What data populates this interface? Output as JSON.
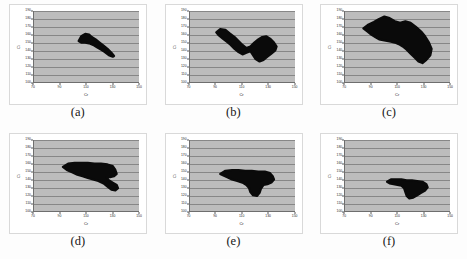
{
  "figure": {
    "title": "",
    "panel_count": 6,
    "background_color": "#ffffff",
    "plot_background_color": "#bcbcbc",
    "blob_color": "#0a0a0a",
    "gridline_color": "#5a5a5a"
  },
  "chart_data": [
    {
      "type": "scatter",
      "title": "",
      "caption": "(a)",
      "xlabel": "Cr",
      "ylabel": "Ci",
      "xlim": [
        70,
        150
      ],
      "ylim": [
        100,
        190
      ],
      "xticks": [
        70,
        90,
        110,
        130,
        150
      ],
      "yticks": [
        100,
        110,
        120,
        130,
        140,
        150,
        160,
        170,
        180,
        190
      ],
      "grid": true,
      "legend": "none",
      "cluster": {
        "x_range": [
          104,
          131
        ],
        "y_range": [
          132,
          161
        ],
        "orientation": "diagonal-descending",
        "area_fraction": 0.09,
        "polygon": [
          [
            104,
            152
          ],
          [
            106,
            158
          ],
          [
            109,
            161
          ],
          [
            112,
            160
          ],
          [
            114,
            157
          ],
          [
            117,
            154
          ],
          [
            120,
            150
          ],
          [
            123,
            146
          ],
          [
            126,
            142
          ],
          [
            129,
            137
          ],
          [
            131,
            133
          ],
          [
            130,
            132
          ],
          [
            127,
            134
          ],
          [
            124,
            138
          ],
          [
            121,
            141
          ],
          [
            118,
            144
          ],
          [
            115,
            147
          ],
          [
            112,
            149
          ],
          [
            109,
            150
          ],
          [
            106,
            150
          ]
        ]
      }
    },
    {
      "type": "scatter",
      "title": "",
      "caption": "(b)",
      "xlabel": "Cr",
      "ylabel": "Ci",
      "xlim": [
        70,
        150
      ],
      "ylim": [
        100,
        190
      ],
      "xticks": [
        70,
        90,
        110,
        130,
        150
      ],
      "yticks": [
        100,
        110,
        120,
        130,
        140,
        150,
        160,
        170,
        180,
        190
      ],
      "grid": true,
      "legend": "none",
      "cluster": {
        "x_range": [
          90,
          136
        ],
        "y_range": [
          126,
          167
        ],
        "orientation": "diagonal-descending-bilobed",
        "area_fraction": 0.2,
        "polygon": [
          [
            90,
            163
          ],
          [
            93,
            167
          ],
          [
            97,
            166
          ],
          [
            100,
            162
          ],
          [
            104,
            157
          ],
          [
            107,
            152
          ],
          [
            110,
            147
          ],
          [
            113,
            143
          ],
          [
            116,
            145
          ],
          [
            119,
            150
          ],
          [
            122,
            154
          ],
          [
            125,
            157
          ],
          [
            128,
            158
          ],
          [
            131,
            155
          ],
          [
            134,
            150
          ],
          [
            136,
            145
          ],
          [
            135,
            140
          ],
          [
            132,
            136
          ],
          [
            129,
            132
          ],
          [
            126,
            128
          ],
          [
            123,
            126
          ],
          [
            120,
            129
          ],
          [
            118,
            134
          ],
          [
            116,
            139
          ],
          [
            113,
            137
          ],
          [
            110,
            135
          ],
          [
            107,
            138
          ],
          [
            104,
            142
          ],
          [
            101,
            147
          ],
          [
            98,
            151
          ],
          [
            95,
            155
          ],
          [
            92,
            159
          ]
        ]
      }
    },
    {
      "type": "scatter",
      "title": "",
      "caption": "(c)",
      "xlabel": "Cr",
      "ylabel": "Ci",
      "xlim": [
        70,
        150
      ],
      "ylim": [
        100,
        190
      ],
      "xticks": [
        70,
        90,
        110,
        130,
        150
      ],
      "yticks": [
        100,
        110,
        120,
        130,
        140,
        150,
        160,
        170,
        180,
        190
      ],
      "grid": true,
      "legend": "none",
      "cluster": {
        "x_range": [
          84,
          136
        ],
        "y_range": [
          124,
          183
        ],
        "orientation": "diagonal-descending-broad",
        "area_fraction": 0.36,
        "polygon": [
          [
            84,
            168
          ],
          [
            88,
            173
          ],
          [
            92,
            176
          ],
          [
            96,
            180
          ],
          [
            100,
            183
          ],
          [
            104,
            181
          ],
          [
            108,
            177
          ],
          [
            112,
            175
          ],
          [
            116,
            177
          ],
          [
            120,
            175
          ],
          [
            124,
            170
          ],
          [
            128,
            164
          ],
          [
            131,
            158
          ],
          [
            134,
            150
          ],
          [
            136,
            142
          ],
          [
            135,
            134
          ],
          [
            132,
            128
          ],
          [
            129,
            124
          ],
          [
            126,
            126
          ],
          [
            123,
            131
          ],
          [
            120,
            136
          ],
          [
            117,
            141
          ],
          [
            114,
            145
          ],
          [
            111,
            148
          ],
          [
            108,
            150
          ],
          [
            105,
            151
          ],
          [
            102,
            152
          ],
          [
            99,
            153
          ],
          [
            96,
            154
          ],
          [
            93,
            157
          ],
          [
            90,
            160
          ],
          [
            87,
            164
          ]
        ]
      }
    },
    {
      "type": "scatter",
      "title": "",
      "caption": "(d)",
      "xlabel": "Cr",
      "ylabel": "Ci",
      "xlim": [
        70,
        150
      ],
      "ylim": [
        100,
        190
      ],
      "xticks": [
        70,
        90,
        110,
        130,
        150
      ],
      "yticks": [
        100,
        110,
        120,
        130,
        140,
        150,
        160,
        170,
        180,
        190
      ],
      "grid": true,
      "legend": "none",
      "cluster": {
        "x_range": [
          92,
          134
        ],
        "y_range": [
          126,
          161
        ],
        "orientation": "horizontal-elongated",
        "area_fraction": 0.24,
        "polygon": [
          [
            92,
            156
          ],
          [
            96,
            160
          ],
          [
            101,
            161
          ],
          [
            106,
            161
          ],
          [
            111,
            161
          ],
          [
            116,
            160
          ],
          [
            121,
            160
          ],
          [
            126,
            159
          ],
          [
            130,
            157
          ],
          [
            132,
            152
          ],
          [
            133,
            147
          ],
          [
            131,
            144
          ],
          [
            128,
            143
          ],
          [
            125,
            143
          ],
          [
            127,
            139
          ],
          [
            130,
            136
          ],
          [
            133,
            133
          ],
          [
            134,
            129
          ],
          [
            132,
            126
          ],
          [
            129,
            127
          ],
          [
            126,
            131
          ],
          [
            123,
            135
          ],
          [
            119,
            138
          ],
          [
            115,
            140
          ],
          [
            111,
            142
          ],
          [
            107,
            144
          ],
          [
            103,
            146
          ],
          [
            99,
            149
          ],
          [
            95,
            152
          ]
        ]
      }
    },
    {
      "type": "scatter",
      "title": "",
      "caption": "(e)",
      "xlabel": "Cr",
      "ylabel": "Ci",
      "xlim": [
        70,
        150
      ],
      "ylim": [
        100,
        190
      ],
      "xticks": [
        70,
        90,
        110,
        130,
        150
      ],
      "yticks": [
        100,
        110,
        120,
        130,
        140,
        150,
        160,
        170,
        180,
        190
      ],
      "grid": true,
      "legend": "none",
      "cluster": {
        "x_range": [
          93,
          134
        ],
        "y_range": [
          119,
          152
        ],
        "orientation": "horizontal-with-tail",
        "area_fraction": 0.18,
        "polygon": [
          [
            93,
            147
          ],
          [
            97,
            151
          ],
          [
            102,
            152
          ],
          [
            107,
            152
          ],
          [
            112,
            151
          ],
          [
            117,
            151
          ],
          [
            122,
            150
          ],
          [
            127,
            150
          ],
          [
            131,
            148
          ],
          [
            133,
            144
          ],
          [
            134,
            140
          ],
          [
            132,
            136
          ],
          [
            129,
            134
          ],
          [
            126,
            133
          ],
          [
            124,
            128
          ],
          [
            123,
            123
          ],
          [
            121,
            119
          ],
          [
            118,
            120
          ],
          [
            116,
            124
          ],
          [
            115,
            129
          ],
          [
            113,
            133
          ],
          [
            110,
            136
          ],
          [
            106,
            138
          ],
          [
            102,
            140
          ],
          [
            98,
            143
          ]
        ]
      }
    },
    {
      "type": "scatter",
      "title": "",
      "caption": "(f)",
      "xlabel": "Cr",
      "ylabel": "Ci",
      "xlim": [
        70,
        150
      ],
      "ylim": [
        100,
        190
      ],
      "xticks": [
        70,
        90,
        110,
        130,
        150
      ],
      "yticks": [
        100,
        110,
        120,
        130,
        140,
        150,
        160,
        170,
        180,
        190
      ],
      "grid": true,
      "legend": "none",
      "cluster": {
        "x_range": [
          102,
          133
        ],
        "y_range": [
          116,
          140
        ],
        "orientation": "compact-low",
        "area_fraction": 0.1,
        "polygon": [
          [
            102,
            137
          ],
          [
            105,
            140
          ],
          [
            109,
            140
          ],
          [
            113,
            140
          ],
          [
            117,
            139
          ],
          [
            121,
            139
          ],
          [
            125,
            138
          ],
          [
            129,
            137
          ],
          [
            132,
            134
          ],
          [
            133,
            130
          ],
          [
            131,
            126
          ],
          [
            128,
            123
          ],
          [
            125,
            120
          ],
          [
            122,
            117
          ],
          [
            119,
            116
          ],
          [
            117,
            119
          ],
          [
            116,
            124
          ],
          [
            115,
            129
          ],
          [
            113,
            132
          ],
          [
            110,
            133
          ],
          [
            107,
            134
          ],
          [
            104,
            135
          ]
        ]
      }
    }
  ]
}
